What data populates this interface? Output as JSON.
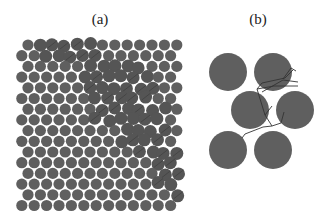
{
  "figure": {
    "panel_a": {
      "label": "(a)",
      "grid": {
        "rows": 16,
        "cols_even": 13,
        "cols_odd": 13,
        "origin_x": 28,
        "origin_y": 45,
        "dx": 12.4,
        "dy": 10.7,
        "odd_offset": -6.2,
        "radius": 5.6
      },
      "damage_band": [
        [
          0,
          1.2,
          2.5,
          3.2
        ],
        [
          1.5,
          5,
          2.6,
          6.8
        ],
        [
          3,
          7,
          2.8,
          7.2
        ],
        [
          4,
          10.5,
          1.8,
          8.6
        ],
        [
          9.5,
          14.5,
          1.7,
          11.4
        ]
      ],
      "particle_color": "#5f5f5f",
      "damaged_color": "#555555"
    },
    "panel_b": {
      "label": "(b)",
      "radius": 19,
      "particles": [
        {
          "x": 228,
          "y": 72
        },
        {
          "x": 273,
          "y": 72
        },
        {
          "x": 250,
          "y": 110
        },
        {
          "x": 295,
          "y": 110
        },
        {
          "x": 228,
          "y": 150
        },
        {
          "x": 273,
          "y": 150
        }
      ],
      "cracks": [
        [
          [
            257,
            89
          ],
          [
            262,
            83
          ],
          [
            285,
            78
          ],
          [
            293,
            70
          ]
        ],
        [
          [
            257,
            89
          ],
          [
            274,
            86
          ],
          [
            298,
            86
          ]
        ],
        [
          [
            262,
            92
          ],
          [
            283,
            80
          ],
          [
            298,
            82
          ]
        ],
        [
          [
            257,
            89
          ],
          [
            265,
            115
          ],
          [
            272,
            126
          ]
        ],
        [
          [
            272,
            126
          ],
          [
            263,
            127
          ],
          [
            245,
            134
          ],
          [
            242,
            138
          ]
        ],
        [
          [
            272,
            126
          ],
          [
            281,
            123
          ],
          [
            284,
            112
          ]
        ],
        [
          [
            283,
            79
          ],
          [
            291,
            68
          ],
          [
            296,
            71
          ]
        ],
        [
          [
            265,
            115
          ],
          [
            272,
            106
          ]
        ]
      ],
      "particle_color": "#5f5f5f",
      "crack_color": "#333333"
    }
  }
}
